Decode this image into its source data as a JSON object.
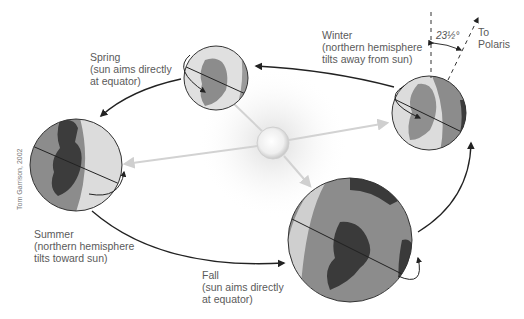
{
  "credit": "Tom Garrison, 2002",
  "axial_tilt_label": "23½°",
  "polaris_label": [
    "To",
    "Polaris"
  ],
  "seasons": [
    {
      "name": "Spring",
      "lines": [
        "Spring",
        "(sun aims directly",
        "at equator)"
      ]
    },
    {
      "name": "Winter",
      "lines": [
        "Winter",
        "(northern hemisphere",
        "tilts away from sun)"
      ]
    },
    {
      "name": "Summer",
      "lines": [
        "Summer",
        "(northern hemisphere",
        "tilts toward sun)"
      ]
    },
    {
      "name": "Fall",
      "lines": [
        "Fall",
        "(sun aims directly",
        "at equator)"
      ]
    }
  ],
  "colors": {
    "orbit": "#222222",
    "ray": "#d0d0d0",
    "sun": "#eeeeee",
    "ocean_lit": "#d8d8d8",
    "ocean_dark": "#8a8a8a",
    "land": "#444444"
  }
}
